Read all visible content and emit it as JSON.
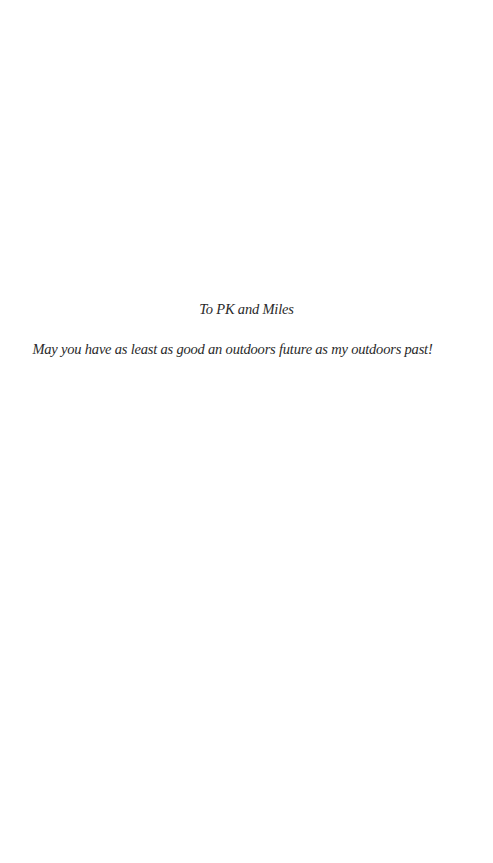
{
  "dedication": {
    "to": "To PK and Miles",
    "message": "May you have as least as good an outdoors future as my outdoors past!"
  }
}
